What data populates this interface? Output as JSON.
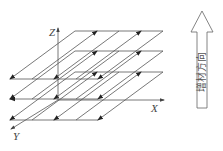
{
  "diagram": {
    "axes": {
      "x_label": "X",
      "y_label": "Y",
      "z_label": "Z"
    },
    "build_direction_label": "增材方向",
    "layers": [
      {
        "name": "layer-top",
        "y_offset": 0
      },
      {
        "name": "layer-middle",
        "y_offset": 20
      },
      {
        "name": "layer-bottom",
        "y_offset": 41
      }
    ],
    "colors": {
      "line": "#555555",
      "arrow": "#222222",
      "background": "#ffffff"
    }
  }
}
